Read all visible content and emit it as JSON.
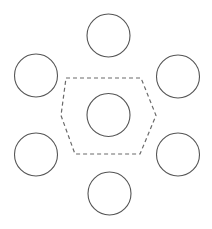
{
  "figure": {
    "name": "hexagonal-close-packing-unit-cell",
    "background_color": "#ffffff",
    "width": 212,
    "height": 229
  },
  "style": {
    "circle_stroke_color": "#555555",
    "circle_stroke_width": 1.1,
    "circle_fill": "none",
    "hexagon_stroke_color": "#6a6a6a",
    "hexagon_stroke_width": 1.2,
    "hexagon_fill": "none",
    "hexagon_dash_pattern": "4 3"
  },
  "chart_data": {
    "type": "scatter",
    "title": "",
    "subtitle": "",
    "xlabel": "",
    "ylabel": "",
    "grid": false,
    "legend": false,
    "annotations": [],
    "circle_radius": 21.5,
    "circles": [
      {
        "id": "center",
        "role": "center-sphere",
        "cx": 108.5,
        "cy": 115.0,
        "r": 21.5
      },
      {
        "id": "top",
        "role": "neighbor-sphere",
        "cx": 108.5,
        "cy": 35.5,
        "r": 21.5
      },
      {
        "id": "upper-left",
        "role": "neighbor-sphere",
        "cx": 36.0,
        "cy": 75.5,
        "r": 21.5
      },
      {
        "id": "upper-right",
        "role": "neighbor-sphere",
        "cx": 178.0,
        "cy": 76.5,
        "r": 21.5
      },
      {
        "id": "lower-left",
        "role": "neighbor-sphere",
        "cx": 36.0,
        "cy": 154.5,
        "r": 21.5
      },
      {
        "id": "lower-right",
        "role": "neighbor-sphere",
        "cx": 178.0,
        "cy": 154.5,
        "r": 21.5
      },
      {
        "id": "bottom",
        "role": "neighbor-sphere",
        "cx": 109.5,
        "cy": 193.5,
        "r": 21.5
      }
    ],
    "hexagon": {
      "id": "unit-cell",
      "role": "unit-cell-outline",
      "dashed": true,
      "points": [
        {
          "x": 66.0,
          "y": 78.0
        },
        {
          "x": 141.0,
          "y": 78.0
        },
        {
          "x": 156.0,
          "y": 115.5
        },
        {
          "x": 140.0,
          "y": 154.0
        },
        {
          "x": 75.0,
          "y": 154.0
        },
        {
          "x": 61.0,
          "y": 115.5
        }
      ]
    }
  }
}
